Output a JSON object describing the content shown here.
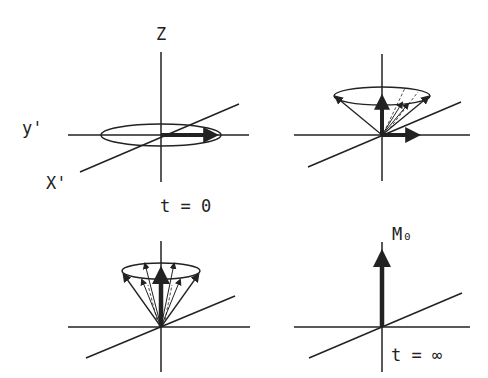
{
  "figure": {
    "panels": [
      {
        "id": "t0",
        "labels": {
          "z_axis": "Z",
          "y_axis": "y'",
          "x_axis": "X'",
          "time": "t = 0"
        }
      },
      {
        "id": "precessing-small-cone",
        "labels": {}
      },
      {
        "id": "precessing-narrow-cone",
        "labels": {}
      },
      {
        "id": "tinf",
        "labels": {
          "magnetization": "M₀",
          "time": "t = ∞"
        }
      }
    ],
    "colors": {
      "line": "#222222",
      "background": "#ffffff"
    }
  }
}
